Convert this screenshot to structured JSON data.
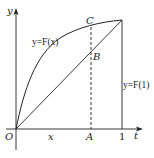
{
  "diagram": {
    "type": "function-graph",
    "axes": {
      "x_label": "t",
      "y_label": "y",
      "origin_label": "O",
      "tick_labels": [
        {
          "id": "x",
          "text": "x",
          "italic": true
        },
        {
          "id": "A",
          "text": "A",
          "italic": true
        },
        {
          "id": "one",
          "text": "1",
          "italic": false
        }
      ]
    },
    "curve": {
      "label": "y=F(x)",
      "shape": "concave increasing from O to (1, F(1))"
    },
    "chord": {
      "from": "O",
      "to": "(1, F(1))"
    },
    "vertical_line": {
      "label": "y=F(1)",
      "at": "t = 1"
    },
    "dashed_line": {
      "at": "A",
      "style": "dashed"
    },
    "points": [
      {
        "id": "C",
        "label": "C",
        "on": "curve y=F(x) above A"
      },
      {
        "id": "B",
        "label": "B",
        "on": "chord above A"
      }
    ],
    "colors": {
      "stroke": "#222222",
      "background": "#ffffff"
    }
  }
}
